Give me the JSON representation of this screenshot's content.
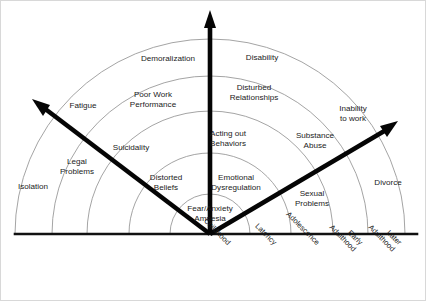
{
  "diagram": {
    "type": "radial-fan",
    "colors": {
      "arc_stroke": "#9a9a9a",
      "axis": "#050505",
      "baseline": "#111111",
      "text": "#1b1b1b",
      "background": "#ffffff"
    },
    "geometry": {
      "center_x": 209,
      "center_y": 233,
      "ring_radii": [
        40,
        81,
        123,
        158,
        195
      ]
    },
    "core": {
      "line1": "Fear/Anxiety",
      "line2": "Amnesia"
    },
    "axes": [
      {
        "name": "left-axis",
        "tip_x": 33,
        "tip_y": 100
      },
      {
        "name": "vertical-axis",
        "tip_x": 209,
        "tip_y": 10
      },
      {
        "name": "right-axis",
        "tip_x": 395,
        "tip_y": 121
      }
    ],
    "ring_labels": [
      {
        "id": "isolation",
        "text": "Isolation",
        "x": 32,
        "y": 186,
        "lines": [
          "Isolation"
        ]
      },
      {
        "id": "legal-problems",
        "text": "Legal Problems",
        "x": 76,
        "y": 166,
        "lines": [
          "Legal",
          "Problems"
        ]
      },
      {
        "id": "fatigue",
        "text": "Fatigue",
        "x": 82,
        "y": 105,
        "lines": [
          "Fatigue"
        ]
      },
      {
        "id": "suicidality",
        "text": "Suicidality",
        "x": 130,
        "y": 147,
        "lines": [
          "Suicidality"
        ]
      },
      {
        "id": "poor-work-performance",
        "text": "Poor Work Performance",
        "x": 152,
        "y": 99,
        "lines": [
          "Poor Work",
          "Performance"
        ]
      },
      {
        "id": "demoralization",
        "text": "Demoralization",
        "x": 167,
        "y": 58,
        "lines": [
          "Demoralization"
        ]
      },
      {
        "id": "distorted-beliefs",
        "text": "Distorted Beliefs",
        "x": 165,
        "y": 182,
        "lines": [
          "Distorted",
          "Beliefs"
        ]
      },
      {
        "id": "acting-out-behaviors",
        "text": "Acting out Behaviors",
        "x": 227,
        "y": 138,
        "lines": [
          "Acting out",
          "Behaviors"
        ]
      },
      {
        "id": "emotional-dysregulation",
        "text": "Emotional Dysregulation",
        "x": 235,
        "y": 182,
        "lines": [
          "Emotional",
          "Dysregulation"
        ]
      },
      {
        "id": "disturbed-relationships",
        "text": "Disturbed Relationships",
        "x": 253,
        "y": 92,
        "lines": [
          "Disturbed",
          "Relationships"
        ]
      },
      {
        "id": "disability",
        "text": "Disability",
        "x": 261,
        "y": 57,
        "lines": [
          "Disability"
        ]
      },
      {
        "id": "sexual-problems",
        "text": "Sexual Problems",
        "x": 311,
        "y": 198,
        "lines": [
          "Sexual",
          "Problems"
        ]
      },
      {
        "id": "substance-abuse",
        "text": "Substance Abuse",
        "x": 314,
        "y": 140,
        "lines": [
          "Substance",
          "Abuse"
        ]
      },
      {
        "id": "inability-to-work",
        "text": "Inability to work",
        "x": 352,
        "y": 113,
        "lines": [
          "Inability",
          "to work"
        ]
      },
      {
        "id": "divorce",
        "text": "Divorce",
        "x": 387,
        "y": 182,
        "lines": [
          "Divorce"
        ]
      }
    ],
    "stage_axis_labels": [
      {
        "id": "childhood",
        "text": "Childhood",
        "x": 228,
        "y": 243
      },
      {
        "id": "latency",
        "text": "Latency",
        "x": 274,
        "y": 243
      },
      {
        "id": "adolescence",
        "text": "Adolescence",
        "x": 317,
        "y": 243
      },
      {
        "id": "early-adulthood",
        "text": "Early Adulthood",
        "x": 360,
        "y": 243,
        "lines": [
          "Early",
          "Adulthood"
        ]
      },
      {
        "id": "later-adulthood",
        "text": "Later Adulthood",
        "x": 399,
        "y": 243,
        "lines": [
          "Later",
          "Adulthood"
        ]
      }
    ]
  }
}
